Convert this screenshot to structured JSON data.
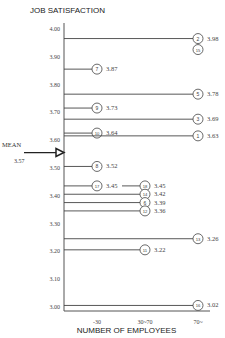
{
  "chart_data": {
    "type": "bar",
    "orientation": "horizontal-lines",
    "title": "JOB SATISFACTION",
    "xlabel": "NUMBER OF EMPLOYEES",
    "ylabel": "JOB SATISFACTION",
    "ylim": [
      3.0,
      4.0
    ],
    "yticks": [
      "4.00",
      "3.90",
      "3.80",
      "3.70",
      "3.60",
      "3.50",
      "3.40",
      "3.30",
      "3.20",
      "3.10",
      "3.00"
    ],
    "xticks": [
      "-30",
      "30~70",
      "70~"
    ],
    "mean": {
      "label": "MEAN",
      "value": "3.57"
    },
    "points": [
      {
        "id": "2",
        "value": 3.98,
        "group": "70~",
        "label": "3.98"
      },
      {
        "id": "15",
        "value": 3.98,
        "group": "70~",
        "label": ""
      },
      {
        "id": "7",
        "value": 3.87,
        "group": "-30",
        "label": "3.87"
      },
      {
        "id": "5",
        "value": 3.78,
        "group": "70~",
        "label": "3.78"
      },
      {
        "id": "9",
        "value": 3.73,
        "group": "-30",
        "label": "3.73"
      },
      {
        "id": "3",
        "value": 3.69,
        "group": "70~",
        "label": "3.69"
      },
      {
        "id": "10",
        "value": 3.64,
        "group": "-30",
        "label": "3.64"
      },
      {
        "id": "1",
        "value": 3.63,
        "group": "70~",
        "label": "3.63"
      },
      {
        "id": "8",
        "value": 3.52,
        "group": "-30",
        "label": "3.52"
      },
      {
        "id": "17",
        "value": 3.45,
        "group": "-30",
        "label": "3.45"
      },
      {
        "id": "18",
        "value": 3.45,
        "group": "30~70",
        "label": "3.45"
      },
      {
        "id": "14",
        "value": 3.42,
        "group": "30~70",
        "label": "3.42"
      },
      {
        "id": "6",
        "value": 3.39,
        "group": "30~70",
        "label": "3.39"
      },
      {
        "id": "12",
        "value": 3.36,
        "group": "30~70",
        "label": "3.36"
      },
      {
        "id": "13",
        "value": 3.26,
        "group": "70~",
        "label": "3.26"
      },
      {
        "id": "11",
        "value": 3.22,
        "group": "30~70",
        "label": "3.22"
      },
      {
        "id": "16",
        "value": 3.02,
        "group": "70~",
        "label": "3.02"
      }
    ],
    "grid": false,
    "legend": null
  }
}
